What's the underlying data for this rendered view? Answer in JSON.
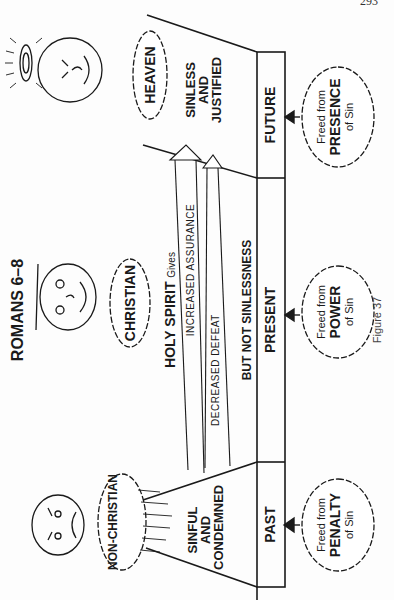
{
  "page": {
    "page_number": "293"
  },
  "figure": {
    "title": "ROMANS 6–8",
    "caption": "Figure 37",
    "holy_spirit_label": "HOLY SPIRIT",
    "gives_label": "Gives",
    "arrows": [
      {
        "label": "INCREASED ASSURANCE"
      },
      {
        "label": "DECREASED DEFEAT"
      }
    ],
    "note": "BUT NOT SINLESSNESS",
    "clouds": {
      "non_christian": "NON-CHRISTIAN",
      "christian": "CHRISTIAN",
      "heaven": "HEAVEN"
    },
    "states": {
      "past": "SINFUL AND CONDEMNED",
      "past_lines": [
        "SINFUL",
        "AND",
        "CONDEMNED"
      ],
      "future_lines": [
        "SINLESS",
        "AND",
        "JUSTIFIED"
      ]
    },
    "timeline": [
      {
        "label": "PAST",
        "freed_line1": "Freed from",
        "freed_line2": "PENALTY",
        "freed_line3": "of Sin"
      },
      {
        "label": "PRESENT",
        "freed_line1": "Freed from",
        "freed_line2": "POWER",
        "freed_line3": "of Sin"
      },
      {
        "label": "FUTURE",
        "freed_line1": "Freed from",
        "freed_line2": "PRESENCE",
        "freed_line3": "of Sin"
      }
    ]
  }
}
